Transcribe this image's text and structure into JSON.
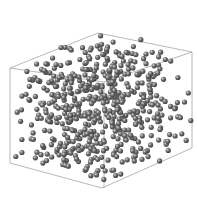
{
  "scene": {
    "background": "#ffffff",
    "box_color": "#9a9a9a",
    "sphere_base": "#6e6e6e",
    "sphere_dark": "#3e3e3e",
    "sphere_light": "#d8d8d8",
    "sphere_radius": 2.6,
    "box": {
      "back_edges": [
        [
          [
            10,
            68
          ],
          [
            98,
            33
          ]
        ],
        [
          [
            98,
            33
          ],
          [
            192,
            52
          ]
        ],
        [
          [
            192,
            52
          ],
          [
            192,
            148
          ]
        ],
        [
          [
            192,
            148
          ],
          [
            102,
            188
          ]
        ],
        [
          [
            102,
            188
          ],
          [
            10,
            163
          ]
        ],
        [
          [
            10,
            163
          ],
          [
            10,
            68
          ]
        ],
        [
          [
            10,
            68
          ],
          [
            104,
            82
          ]
        ],
        [
          [
            104,
            82
          ],
          [
            192,
            52
          ]
        ],
        [
          [
            104,
            82
          ],
          [
            104,
            188
          ]
        ]
      ]
    },
    "particle_seed": 1337,
    "particle_count": 560
  }
}
